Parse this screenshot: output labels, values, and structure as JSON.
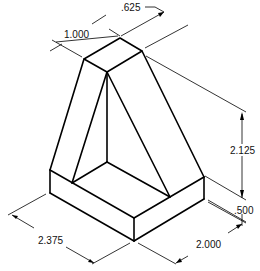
{
  "figure": {
    "type": "isometric-technical-drawing",
    "colors": {
      "line": "#000000",
      "background": "#ffffff"
    }
  },
  "dimensions": [
    {
      "id": "top_width",
      "label": ".625"
    },
    {
      "id": "top_depth",
      "label": "1.000"
    },
    {
      "id": "height",
      "label": "2.125"
    },
    {
      "id": "base_thickness",
      "label": ".500"
    },
    {
      "id": "base_length",
      "label": "2.375"
    },
    {
      "id": "base_width",
      "label": "2.000"
    }
  ],
  "labels": {
    "top_width": ".625",
    "top_depth": "1.000",
    "height": "2.125",
    "base_thickness": ".500",
    "base_length": "2.375",
    "base_width": "2.000"
  }
}
